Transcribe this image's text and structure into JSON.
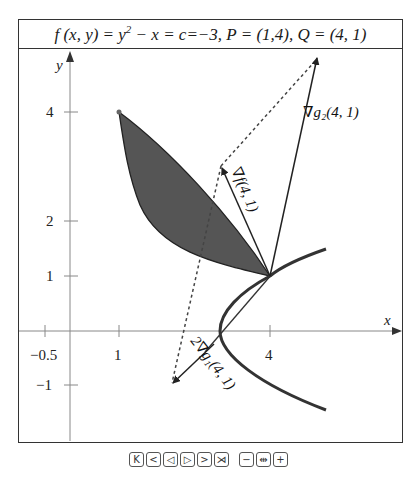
{
  "title": {
    "f_part": "f (x, y) = y",
    "exp": "2",
    "rest": " − x = c=−3,   P = (1,4),   Q = (4, 1)"
  },
  "axes": {
    "x_label": "x",
    "y_label": "y",
    "x_ticks": [
      "−0.5",
      "1",
      "4"
    ],
    "y_ticks": [
      "4",
      "2",
      "1",
      "−1"
    ]
  },
  "labels": {
    "grad_g2": "∇g₂(4, 1)",
    "grad_f": "∇f(4, 1)",
    "grad_g1": "2∇g₁(4, 1)"
  },
  "points": {
    "P": [
      1,
      4
    ],
    "Q": [
      4,
      1
    ]
  },
  "colors": {
    "shade": "#555555",
    "curve": "#333333",
    "axis": "#888888"
  },
  "controls": {
    "first": "K",
    "prev": "<",
    "step_back": "◁",
    "step_fwd": "▷",
    "next": ">",
    "last": "⋊",
    "zoom_out": "−",
    "reset": "⇹",
    "zoom_in": "+"
  }
}
